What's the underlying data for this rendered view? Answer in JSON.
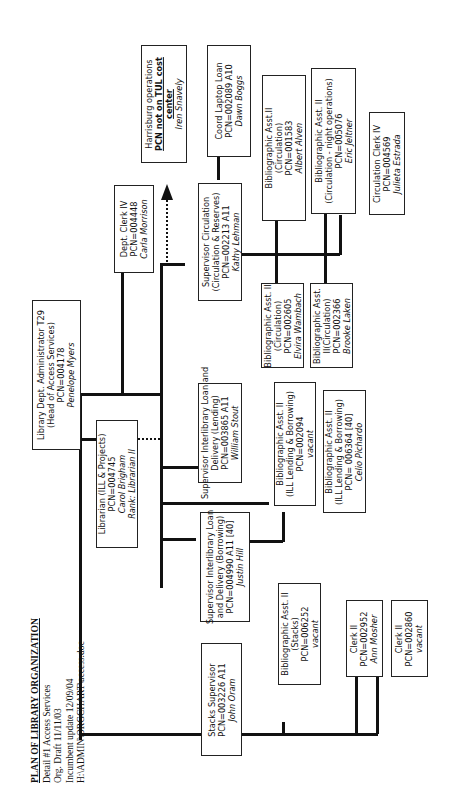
{
  "header": {
    "title": "PLAN OF LIBRARY ORGANIZATION",
    "lines": [
      "Detail #1 Access Services",
      "Org. Draft 11/11/03",
      "Incumbent update 12/09/04",
      "H:\\ADMIN\\ORGCHART\\access.doc"
    ]
  },
  "positions": {
    "head": {
      "lines": [
        "Library Dept. Administrator T29",
        "(Head of Access Services)",
        "PCN=004178"
      ],
      "name": "Penelope Myers"
    },
    "dept_clerk": {
      "lines": [
        "Dept. Clerk IV",
        "PCN=004448"
      ],
      "name": "Carla Morrison"
    },
    "librarian": {
      "lines": [
        "Librarian (ILL & Projects)",
        "PCN=004745"
      ],
      "name": "Carol Brigham",
      "rank": "Rank: Librarian II"
    },
    "harrisburg": {
      "line1": "Harrisburg operations",
      "bold1": "PCN not on TUL cost",
      "bold2": "center",
      "name": "Iren Snavely"
    },
    "sup_circ": {
      "lines": [
        "Supervisor Circulation",
        "(Circulation & Reserves)",
        "PCN=002213   A11"
      ],
      "name": "Kathy Lehman"
    },
    "coord_laptop": {
      "lines": [
        "Coord Laptop Loan",
        "PCN=002089   A10"
      ],
      "name": "Dawn Boggs"
    },
    "ba_circ_1583": {
      "lines": [
        "Bibliographic Asst.II",
        "(Circulation)",
        "PCN=001583"
      ],
      "name": "Albert Alven"
    },
    "ba_night": {
      "lines": [
        "Bibliographic Asst. II",
        "(Circulation - night operations)",
        "PCN=005076"
      ],
      "name": "Eric Jeltner"
    },
    "circ_clerk": {
      "lines": [
        "Circulation  Clerk IV",
        "PCN=004569"
      ],
      "name": "Julieta Estrada"
    },
    "ba_circ_2605": {
      "lines": [
        "Bibliographic Asst. II",
        "(Circulation)",
        "PCN=002605"
      ],
      "name": "Elvira Wambach"
    },
    "ba_circ_2366": {
      "lines": [
        "Bibliographic Asst.",
        "II(Circulation)",
        "PCN=002366"
      ],
      "name": "Brooke Laken"
    },
    "sup_ill_lend": {
      "lines": [
        "Supervisor Interlibrary Loan and",
        "Delivery (Lending)",
        "PCN=003865 A11"
      ],
      "name": "William Stout"
    },
    "ba_ill_2094": {
      "lines": [
        "Bibliographic Asst. II",
        "(ILL Lending & Borrowing)",
        "PCN=002094"
      ],
      "name": "vacant"
    },
    "ba_ill_6364": {
      "lines": [
        "Bibliographic Asst. II",
        "(ILL Lending & Borrowing)",
        "PCN= 006364 [40]"
      ],
      "name": "Celio Pichardo"
    },
    "sup_ill_borrow": {
      "lines": [
        "Supervisor Interlibrary Loan",
        "and Delivery (Borrowing)",
        "PCN=004990 A11 [40]"
      ],
      "name": "Justin Hill"
    },
    "stacks_sup": {
      "lines": [
        "Stacks  Supervisor",
        "PCN=003226 A11"
      ],
      "name": "John Oram"
    },
    "ba_stacks": {
      "lines": [
        "Bibliographic Asst. II",
        "(Stacks)",
        "PCN=006252"
      ],
      "name": "vacant"
    },
    "clerk_2952": {
      "lines": [
        "Clerk II",
        "PCN=002952"
      ],
      "name": "Ann Mosher"
    },
    "clerk_2860": {
      "lines": [
        "Clerk II",
        "PCN=002860"
      ],
      "name": "vacant"
    }
  }
}
